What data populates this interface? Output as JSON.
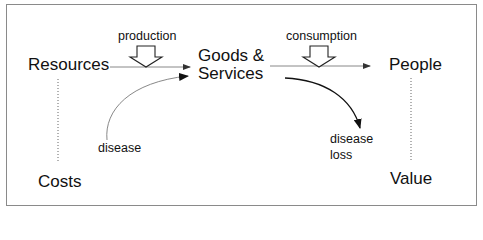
{
  "diagram": {
    "nodes": {
      "resources": "Resources",
      "goods_line1": "Goods &",
      "goods_line2": "Services",
      "people": "People",
      "costs": "Costs",
      "value": "Value"
    },
    "flow_labels": {
      "production": "production",
      "consumption": "consumption",
      "disease": "disease",
      "disease_loss_line1": "disease",
      "disease_loss_line2": "loss"
    },
    "edges": [
      {
        "from": "Resources",
        "to": "Goods & Services",
        "label": "production",
        "style": "arrow"
      },
      {
        "from": "disease",
        "to": "Goods & Services",
        "style": "curved-arrow"
      },
      {
        "from": "Goods & Services",
        "to": "People",
        "label": "consumption",
        "style": "arrow"
      },
      {
        "from": "Goods & Services",
        "to": "disease loss",
        "style": "curved-arrow"
      },
      {
        "from": "Resources",
        "to": "Costs",
        "style": "dotted"
      },
      {
        "from": "People",
        "to": "Value",
        "style": "dotted"
      }
    ],
    "colors": {
      "frame": "#8a8a8a",
      "thin_line": "#7a7a7a",
      "bold_line": "#111111",
      "text": "#111111"
    }
  }
}
